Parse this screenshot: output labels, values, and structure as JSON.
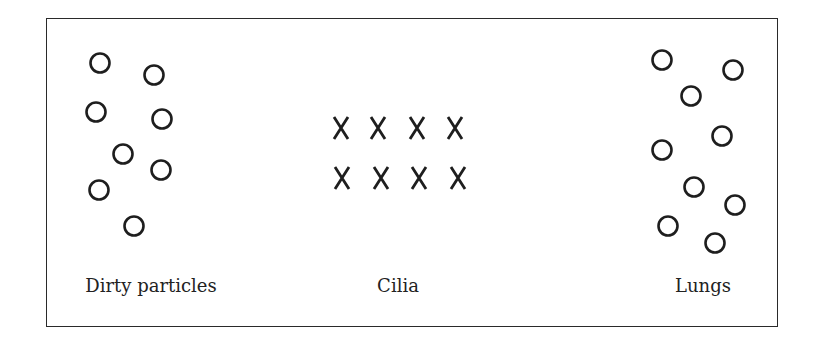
{
  "diagram": {
    "groups": [
      {
        "id": "dirty-particles",
        "label": "Dirty particles",
        "label_pos": [
          151,
          275
        ],
        "symbol": "circle",
        "items": [
          [
            100,
            63
          ],
          [
            154,
            75
          ],
          [
            96,
            112
          ],
          [
            162,
            119
          ],
          [
            123,
            154
          ],
          [
            161,
            170
          ],
          [
            99,
            190
          ],
          [
            134,
            226
          ]
        ]
      },
      {
        "id": "cilia",
        "label": "Cilia",
        "label_pos": [
          398,
          275
        ],
        "symbol": "x",
        "items": [
          [
            341,
            128
          ],
          [
            378,
            128
          ],
          [
            417,
            128
          ],
          [
            455,
            128
          ],
          [
            342,
            178
          ],
          [
            381,
            178
          ],
          [
            419,
            178
          ],
          [
            458,
            178
          ]
        ]
      },
      {
        "id": "lungs",
        "label": "Lungs",
        "label_pos": [
          703,
          275
        ],
        "symbol": "circle",
        "items": [
          [
            662,
            60
          ],
          [
            733,
            70
          ],
          [
            691,
            96
          ],
          [
            722,
            136
          ],
          [
            662,
            150
          ],
          [
            694,
            187
          ],
          [
            735,
            205
          ],
          [
            668,
            226
          ],
          [
            715,
            243
          ]
        ]
      }
    ],
    "stroke_color": "#1e1e1e"
  }
}
